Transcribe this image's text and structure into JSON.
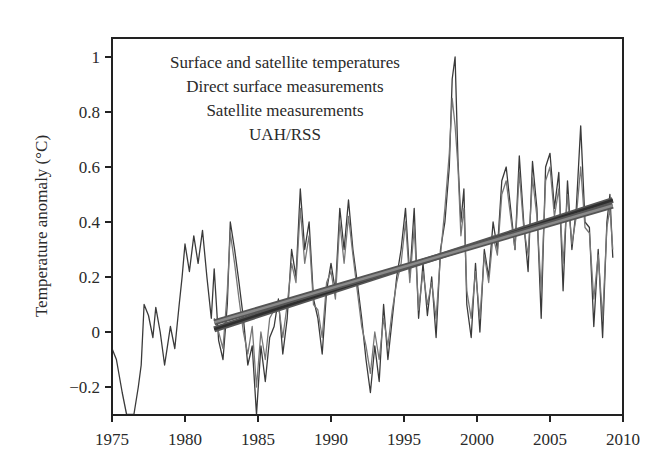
{
  "chart_data": {
    "type": "line",
    "title": "",
    "xlabel": "",
    "ylabel": "Temperature anomaly (°C)",
    "xlim": [
      1975,
      2010
    ],
    "ylim": [
      -0.3,
      1.06
    ],
    "grid": false,
    "x_ticks": [
      1975,
      1980,
      1985,
      1990,
      1995,
      2000,
      2005,
      2010
    ],
    "x_tick_labels": [
      "1975",
      "1980",
      "1985",
      "1990",
      "1995",
      "2000",
      "2005",
      "2010"
    ],
    "y_ticks": [
      -0.2,
      0,
      0.2,
      0.4,
      0.6,
      0.8,
      1
    ],
    "y_tick_labels": [
      "−0.2",
      "0",
      "0.2",
      "0.4",
      "0.6",
      "0.8",
      "1"
    ],
    "legend_position": "upper-center (inside plot)",
    "legend": [
      "Surface and satellite temperatures",
      "Direct surface measurements",
      "Satellite measurements",
      "UAH/RSS"
    ],
    "series": [
      {
        "name": "Direct surface measurements",
        "color": "#3a3a3a",
        "x": [
          1975.0,
          1975.3,
          1975.7,
          1976.0,
          1976.5,
          1976.8,
          1977.0,
          1977.2,
          1977.5,
          1977.8,
          1978.0,
          1978.3,
          1978.6,
          1978.8,
          1979.0,
          1979.3,
          1979.6,
          1979.8,
          1980.0,
          1980.3,
          1980.6,
          1980.9,
          1981.2,
          1981.5,
          1981.8,
          1982.0,
          1982.3,
          1982.6,
          1982.9,
          1983.1,
          1983.4,
          1983.7,
          1984.0,
          1984.3,
          1984.6,
          1984.9,
          1985.2,
          1985.5,
          1985.8,
          1986.1,
          1986.4,
          1986.7,
          1987.0,
          1987.3,
          1987.6,
          1987.9,
          1988.2,
          1988.5,
          1988.8,
          1989.1,
          1989.4,
          1989.7,
          1990.0,
          1990.3,
          1990.6,
          1990.9,
          1991.2,
          1991.5,
          1991.8,
          1992.1,
          1992.4,
          1992.7,
          1993.0,
          1993.3,
          1993.6,
          1993.9,
          1994.2,
          1994.5,
          1994.8,
          1995.1,
          1995.4,
          1995.7,
          1996.0,
          1996.3,
          1996.6,
          1996.9,
          1997.2,
          1997.5,
          1997.8,
          1998.1,
          1998.3,
          1998.5,
          1998.7,
          1998.9,
          1999.1,
          1999.3,
          1999.6,
          1999.9,
          2000.2,
          2000.5,
          2000.8,
          2001.1,
          2001.4,
          2001.7,
          2002.0,
          2002.3,
          2002.6,
          2002.9,
          2003.2,
          2003.5,
          2003.8,
          2004.1,
          2004.4,
          2004.7,
          2005.0,
          2005.3,
          2005.6,
          2005.9,
          2006.2,
          2006.5,
          2006.8,
          2007.1,
          2007.4,
          2007.7,
          2008.0,
          2008.3,
          2008.6,
          2008.9,
          2009.1,
          2009.3
        ],
        "values": [
          -0.06,
          -0.1,
          -0.22,
          -0.3,
          -0.3,
          -0.2,
          -0.12,
          0.1,
          0.06,
          -0.02,
          0.09,
          0.0,
          -0.12,
          -0.05,
          0.02,
          -0.06,
          0.1,
          0.2,
          0.32,
          0.22,
          0.35,
          0.25,
          0.37,
          0.2,
          0.05,
          0.23,
          -0.03,
          -0.1,
          0.1,
          0.4,
          0.3,
          0.18,
          0.05,
          -0.12,
          -0.05,
          -0.3,
          -0.05,
          -0.18,
          -0.02,
          0.02,
          0.12,
          -0.08,
          0.05,
          0.3,
          0.2,
          0.52,
          0.3,
          0.4,
          0.12,
          0.05,
          -0.08,
          0.15,
          0.25,
          0.15,
          0.45,
          0.3,
          0.48,
          0.3,
          0.18,
          0.05,
          -0.1,
          -0.22,
          -0.05,
          -0.18,
          0.1,
          -0.1,
          0.05,
          0.2,
          0.3,
          0.45,
          0.2,
          0.45,
          0.05,
          0.25,
          0.06,
          0.2,
          -0.02,
          0.3,
          0.4,
          0.6,
          0.92,
          1.0,
          0.62,
          0.4,
          0.52,
          0.1,
          -0.02,
          0.25,
          0.0,
          0.3,
          0.2,
          0.4,
          0.3,
          0.55,
          0.6,
          0.45,
          0.3,
          0.64,
          0.4,
          0.22,
          0.62,
          0.45,
          0.05,
          0.6,
          0.65,
          0.45,
          0.58,
          0.15,
          0.55,
          0.3,
          0.45,
          0.75,
          0.4,
          0.38,
          0.02,
          0.3,
          -0.02,
          0.4,
          0.5,
          0.27
        ]
      },
      {
        "name": "Satellite measurements (UAH/RSS)",
        "color": "#777777",
        "x": [
          1982.0,
          1982.3,
          1982.6,
          1982.9,
          1983.1,
          1983.4,
          1983.7,
          1984.0,
          1984.3,
          1984.6,
          1984.9,
          1985.2,
          1985.5,
          1985.8,
          1986.1,
          1986.4,
          1986.7,
          1987.0,
          1987.3,
          1987.6,
          1987.9,
          1988.2,
          1988.5,
          1988.8,
          1989.1,
          1989.4,
          1989.7,
          1990.0,
          1990.3,
          1990.6,
          1990.9,
          1991.2,
          1991.5,
          1991.8,
          1992.1,
          1992.4,
          1992.7,
          1993.0,
          1993.3,
          1993.6,
          1993.9,
          1994.2,
          1994.5,
          1994.8,
          1995.1,
          1995.4,
          1995.7,
          1996.0,
          1996.3,
          1996.6,
          1996.9,
          1997.2,
          1997.5,
          1997.8,
          1998.1,
          1998.3,
          1998.5,
          1998.7,
          1998.9,
          1999.1,
          1999.3,
          1999.6,
          1999.9,
          2000.2,
          2000.5,
          2000.8,
          2001.1,
          2001.4,
          2001.7,
          2002.0,
          2002.3,
          2002.6,
          2002.9,
          2003.2,
          2003.5,
          2003.8,
          2004.1,
          2004.4,
          2004.7,
          2005.0,
          2005.3,
          2005.6,
          2005.9,
          2006.2,
          2006.5,
          2006.8,
          2007.1,
          2007.4,
          2007.7,
          2008.0,
          2008.3,
          2008.6,
          2008.9,
          2009.1,
          2009.3
        ],
        "values": [
          0.05,
          0.0,
          -0.06,
          0.15,
          0.36,
          0.25,
          0.12,
          0.0,
          -0.08,
          0.02,
          -0.2,
          0.0,
          -0.1,
          0.05,
          0.08,
          0.1,
          -0.02,
          0.1,
          0.25,
          0.18,
          0.45,
          0.25,
          0.35,
          0.1,
          0.08,
          -0.02,
          0.18,
          0.22,
          0.12,
          0.4,
          0.25,
          0.42,
          0.28,
          0.15,
          0.02,
          -0.05,
          -0.15,
          0.0,
          -0.1,
          0.05,
          -0.05,
          0.08,
          0.18,
          0.25,
          0.4,
          0.18,
          0.38,
          0.08,
          0.22,
          0.1,
          0.18,
          0.05,
          0.28,
          0.45,
          0.65,
          0.85,
          0.75,
          0.6,
          0.35,
          0.45,
          0.15,
          0.05,
          0.22,
          0.05,
          0.28,
          0.18,
          0.35,
          0.28,
          0.5,
          0.55,
          0.42,
          0.3,
          0.58,
          0.38,
          0.28,
          0.56,
          0.42,
          0.15,
          0.55,
          0.6,
          0.42,
          0.52,
          0.25,
          0.5,
          0.32,
          0.42,
          0.6,
          0.38,
          0.36,
          0.12,
          0.28,
          0.05,
          0.38,
          0.45,
          0.3
        ]
      },
      {
        "name": "Trend (surface)",
        "color": "#2e2e2e",
        "x": [
          1982.0,
          2009.3
        ],
        "values": [
          0.01,
          0.48
        ]
      },
      {
        "name": "Trend (satellite)",
        "color": "#8a8a8a",
        "x": [
          1982.0,
          2009.3
        ],
        "values": [
          0.035,
          0.46
        ]
      }
    ]
  }
}
